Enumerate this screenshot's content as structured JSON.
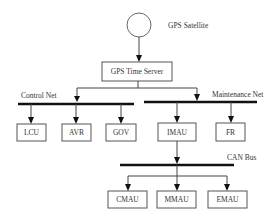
{
  "diagram": {
    "satellite": {
      "label": "GPS Satellite"
    },
    "server": {
      "label": "GPS Time Server"
    },
    "buses": {
      "control": {
        "label": "Control Net"
      },
      "maintenance": {
        "label": "Maintenance Net"
      },
      "can": {
        "label": "CAN Bus"
      }
    },
    "control_nodes": [
      {
        "label": "LCU"
      },
      {
        "label": "AVR"
      },
      {
        "label": "GOV"
      }
    ],
    "maintenance_nodes": [
      {
        "label": "IMAU"
      },
      {
        "label": "FR"
      }
    ],
    "can_nodes": [
      {
        "label": "CMAU"
      },
      {
        "label": "MMAU"
      },
      {
        "label": "EMAU"
      }
    ]
  }
}
